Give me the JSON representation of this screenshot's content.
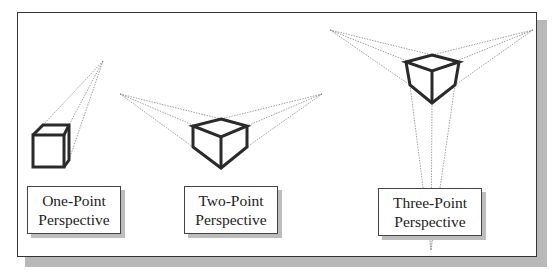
{
  "figure": {
    "panels": [
      {
        "id": "one-point",
        "line1": "One-Point",
        "line2": "Perspective"
      },
      {
        "id": "two-point",
        "line1": "Two-Point",
        "line2": "Perspective"
      },
      {
        "id": "three-point",
        "line1": "Three-Point",
        "line2": "Perspective"
      }
    ]
  },
  "colors": {
    "frame": "#333333",
    "shadow": "#b8b8b8",
    "cube_edge": "#2a2a2a",
    "construction_line": "#777777"
  }
}
